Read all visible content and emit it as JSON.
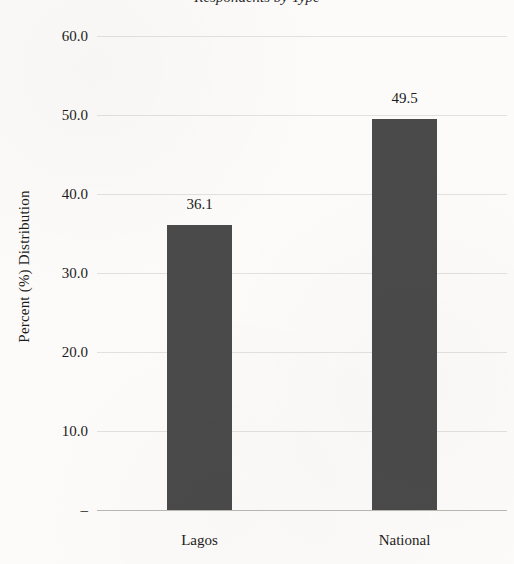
{
  "figure": {
    "title_fragment": "Respondents by Type",
    "background_color": "#fcfbf9",
    "bar_color": "#4a4a4a",
    "gridline_color": "#e2e1dd",
    "axis_color": "#b9b7b2"
  },
  "chart_data": {
    "type": "bar",
    "title": "",
    "categories": [
      "Lagos",
      "National"
    ],
    "values": [
      36.1,
      49.5
    ],
    "value_labels": [
      "36.1",
      "49.5"
    ],
    "xlabel": "",
    "ylabel": "Percent (%) Distribution",
    "ylim": [
      0,
      60
    ],
    "yticks": [
      0,
      10,
      20,
      30,
      40,
      50,
      60
    ],
    "ytick_labels": [
      "–",
      "10.0",
      "20.0",
      "30.0",
      "40.0",
      "50.0",
      "60.0"
    ],
    "grid": true,
    "grid_axis": "y",
    "legend": false,
    "legend_position": "none",
    "orientation": "vertical",
    "series": [
      {
        "name": "Percent (%) Distribution",
        "color": "#4a4a4a",
        "values": [
          36.1,
          49.5
        ]
      }
    ]
  }
}
